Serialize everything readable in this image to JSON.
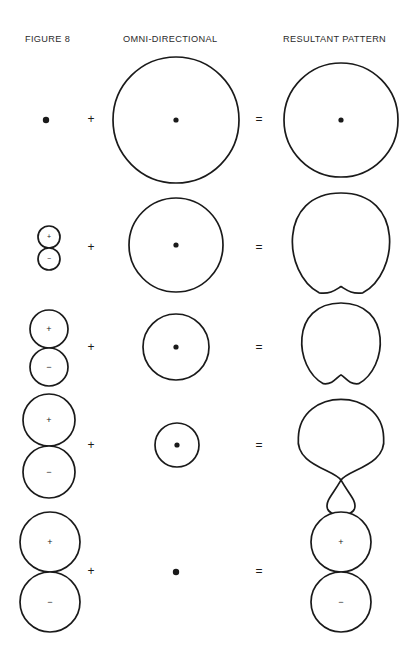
{
  "figure": {
    "title_columns": [
      {
        "id": "figure-8",
        "label": "FIGURE 8",
        "x": 25,
        "y": 42
      },
      {
        "id": "omni-directional",
        "label": "OMNI-DIRECTIONAL",
        "x": 123,
        "y": 42
      },
      {
        "id": "resultant-pattern",
        "label": "RESULTANT PATTERN",
        "x": 283,
        "y": 42
      }
    ],
    "operators": {
      "plus": "+",
      "equals": "="
    },
    "lobe_labels": {
      "positive": "+",
      "negative": "−"
    },
    "colors": {
      "stroke": "#1a1a1a",
      "fill": "#ffffff",
      "background": "#ffffff",
      "text": "#2b2b2b"
    },
    "rows": [
      {
        "id": "row-1-omnidirectional",
        "center_y": 120,
        "figure8": {
          "type": "point",
          "cx": 46,
          "cy": 120,
          "r": 3.2
        },
        "omni": {
          "type": "circle",
          "cx": 176,
          "cy": 120,
          "r": 63,
          "has_center_dot": true
        },
        "result": {
          "type": "circle",
          "cx": 341,
          "cy": 120,
          "r": 57,
          "has_center_dot": true
        },
        "plus_x": 91,
        "equals_x": 259
      },
      {
        "id": "row-2-wide-cardioid",
        "center_y": 248,
        "figure8": {
          "type": "figure8",
          "cx": 49,
          "cy": 248,
          "r": 11
        },
        "omni": {
          "type": "circle",
          "cx": 176,
          "cy": 245,
          "r": 47,
          "has_center_dot": true
        },
        "result": {
          "type": "cardioid",
          "cx": 341,
          "cy": 245,
          "r": 52,
          "notch": 0.22
        },
        "plus_x": 91,
        "equals_x": 259
      },
      {
        "id": "row-3-cardioid",
        "center_y": 348,
        "figure8": {
          "type": "figure8",
          "cx": 49,
          "cy": 348,
          "r": 19
        },
        "omni": {
          "type": "circle",
          "cx": 176,
          "cy": 347,
          "r": 33,
          "has_center_dot": true
        },
        "result": {
          "type": "cardioid",
          "cx": 341,
          "cy": 345,
          "r": 42,
          "notch": 0.38
        },
        "plus_x": 91,
        "equals_x": 259
      },
      {
        "id": "row-4-hypercardioid",
        "center_y": 446,
        "figure8": {
          "type": "figure8",
          "cx": 49,
          "cy": 446,
          "r": 26
        },
        "omni": {
          "type": "circle",
          "cx": 177,
          "cy": 445,
          "r": 22,
          "has_center_dot": true
        },
        "result": {
          "type": "hypercardioid",
          "cx": 341,
          "cy": 440,
          "r": 41,
          "rear_lobe_r": 15
        },
        "plus_x": 91,
        "equals_x": 259
      },
      {
        "id": "row-5-bidirectional",
        "center_y": 572,
        "figure8": {
          "type": "figure8",
          "cx": 50,
          "cy": 572,
          "r": 30
        },
        "omni": {
          "type": "point",
          "cx": 176,
          "cy": 572,
          "r": 3.2
        },
        "result": {
          "type": "figure8",
          "cx": 341,
          "cy": 572,
          "r": 30
        },
        "plus_x": 91,
        "equals_x": 259
      }
    ]
  }
}
